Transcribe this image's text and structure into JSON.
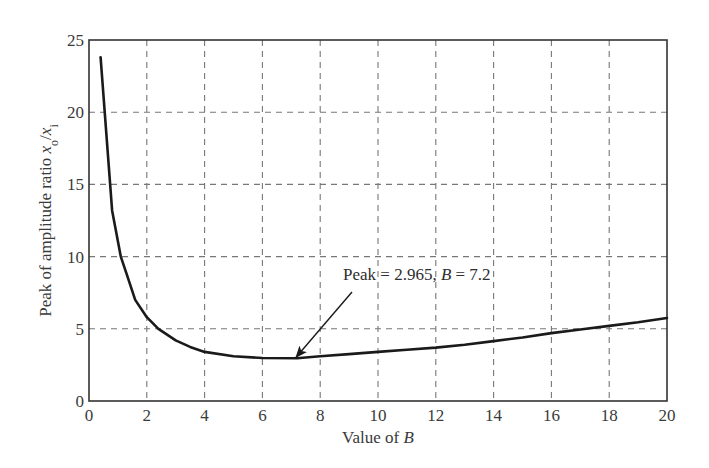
{
  "chart_data": {
    "type": "line",
    "title": "",
    "xlabel": "Value of B",
    "xlabel_parts": [
      {
        "text": "Value of ",
        "italic": false
      },
      {
        "text": "B",
        "italic": true
      }
    ],
    "ylabel": "Peak of amplitude ratio x_o/x_i",
    "ylabel_parts": [
      {
        "text": "Peak of amplitude ratio ",
        "italic": false
      },
      {
        "text": "x",
        "italic": true
      },
      {
        "text": "o",
        "sub": true
      },
      {
        "text": "/",
        "italic": false
      },
      {
        "text": "x",
        "italic": true
      },
      {
        "text": "i",
        "sub": true
      }
    ],
    "xlim": [
      0,
      20
    ],
    "ylim": [
      0,
      25
    ],
    "xticks": [
      0,
      2,
      4,
      6,
      8,
      10,
      12,
      14,
      16,
      18,
      20
    ],
    "yticks": [
      0,
      5,
      10,
      15,
      20,
      25
    ],
    "grid": true,
    "grid_style": "dashed",
    "legend": null,
    "series": [
      {
        "name": "Peak amplitude ratio",
        "color": "#1a1a1a",
        "x": [
          0.4,
          0.8,
          1.1,
          1.3,
          1.6,
          2.0,
          2.4,
          3.0,
          3.5,
          4.0,
          5.0,
          6.0,
          7.2,
          8.0,
          9.0,
          10.0,
          11.0,
          12.0,
          13.0,
          14.0,
          15.0,
          16.0,
          17.0,
          18.0,
          19.0,
          20.0
        ],
        "y": [
          23.8,
          13.2,
          10.0,
          8.8,
          7.0,
          5.8,
          5.0,
          4.2,
          3.75,
          3.4,
          3.1,
          2.98,
          2.965,
          3.1,
          3.25,
          3.4,
          3.55,
          3.7,
          3.9,
          4.15,
          4.4,
          4.7,
          4.95,
          5.2,
          5.45,
          5.75
        ]
      }
    ],
    "annotations": [
      {
        "text": "Peak = 2.965, B = 7.2",
        "parts": [
          {
            "text": "Peak = 2.965, ",
            "italic": false
          },
          {
            "text": "B",
            "italic": true
          },
          {
            "text": " = 7.2",
            "italic": false
          }
        ],
        "arrow_to": {
          "x": 7.2,
          "y": 2.965
        },
        "text_at": {
          "x": 9.0,
          "y": 8.5
        }
      }
    ]
  }
}
